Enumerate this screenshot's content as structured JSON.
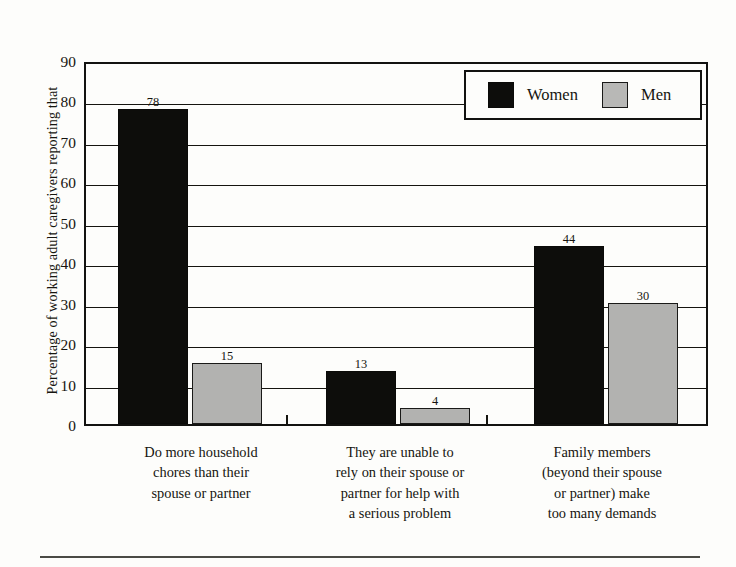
{
  "chart_data": {
    "type": "bar",
    "title": "",
    "xlabel": "",
    "ylabel": "Percentage of working adult caregivers reporting that",
    "ylim": [
      0,
      90
    ],
    "ytick_labels": [
      "0",
      "10",
      "20",
      "30",
      "40",
      "50",
      "60",
      "70",
      "80",
      "90"
    ],
    "ytick_values": [
      0,
      10,
      20,
      30,
      40,
      50,
      60,
      70,
      80,
      90
    ],
    "grid": "horizontal",
    "legend_position": "top-right",
    "categories": [
      "Do more household chores than their spouse or partner",
      "They are unable to rely on their spouse or partner for help with a serious problem",
      "Family members (beyond their spouse or partner) make too many demands"
    ],
    "category_label_lines": [
      [
        "Do more household",
        "chores than their",
        "spouse or partner"
      ],
      [
        "They are unable to",
        "rely on their spouse or",
        "partner for help with",
        "a serious problem"
      ],
      [
        "Family members",
        "(beyond their spouse",
        "or partner) make",
        "too many demands"
      ]
    ],
    "series": [
      {
        "name": "Women",
        "color": "#0d0d0b",
        "values": [
          78,
          13,
          44
        ]
      },
      {
        "name": "Men",
        "color": "#b2b2b0",
        "values": [
          15,
          4,
          30
        ]
      }
    ]
  },
  "legend": {
    "entries": [
      {
        "label": "Women",
        "color": "#0d0d0b"
      },
      {
        "label": "Men",
        "color": "#b8b8b6"
      }
    ]
  }
}
